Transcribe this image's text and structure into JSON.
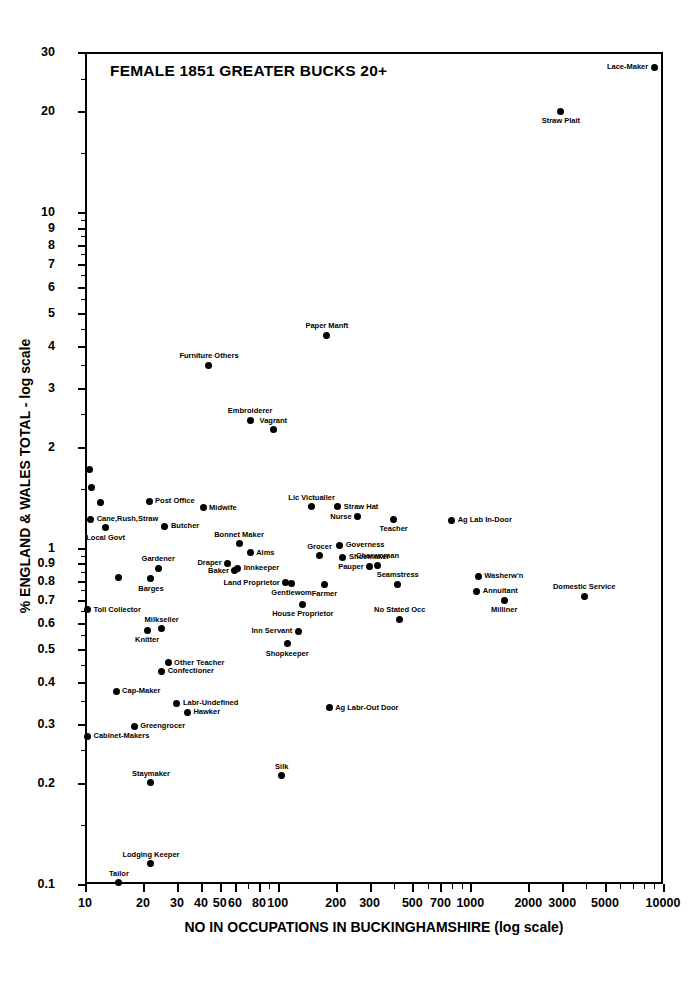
{
  "chart_data": {
    "type": "scatter",
    "title": "FEMALE 1851 GREATER BUCKS 20+",
    "xlabel": "NO IN OCCUPATIONS IN BUCKINGHAMSHIRE (log scale)",
    "ylabel": "% ENGLAND & WALES TOTAL - log scale",
    "xscale": "log",
    "yscale": "log",
    "xlim": [
      10,
      10000
    ],
    "ylim": [
      0.1,
      30
    ],
    "grid": false,
    "legend": "none",
    "marker_color": "#000000",
    "background_color": "#ffffff",
    "xticks": [
      {
        "value": 10,
        "label": "10",
        "major": true
      },
      {
        "value": 20,
        "label": "20",
        "major": true
      },
      {
        "value": 30,
        "label": "30",
        "major": true
      },
      {
        "value": 40,
        "label": "40",
        "major": true
      },
      {
        "value": 50,
        "label": "50",
        "major": true
      },
      {
        "value": 60,
        "label": "60",
        "major": true
      },
      {
        "value": 80,
        "label": "80",
        "major": true
      },
      {
        "value": 100,
        "label": "100",
        "major": true
      },
      {
        "value": 200,
        "label": "200",
        "major": true
      },
      {
        "value": 300,
        "label": "300",
        "major": true
      },
      {
        "value": 500,
        "label": "500",
        "major": true
      },
      {
        "value": 700,
        "label": "700",
        "major": true
      },
      {
        "value": 1000,
        "label": "1000",
        "major": true
      },
      {
        "value": 2000,
        "label": "2000",
        "major": true
      },
      {
        "value": 3000,
        "label": "3000",
        "major": true
      },
      {
        "value": 5000,
        "label": "5000",
        "major": true
      },
      {
        "value": 10000,
        "label": "10000",
        "major": true
      }
    ],
    "xminor": [
      70,
      90,
      400,
      600,
      800,
      900,
      4000,
      6000,
      7000,
      8000,
      9000
    ],
    "yticks": [
      {
        "value": 30,
        "label": "30"
      },
      {
        "value": 20,
        "label": "20"
      },
      {
        "value": 10,
        "label": "10"
      },
      {
        "value": 9,
        "label": "9"
      },
      {
        "value": 8,
        "label": "8"
      },
      {
        "value": 7,
        "label": "7"
      },
      {
        "value": 6,
        "label": "6"
      },
      {
        "value": 5,
        "label": "5"
      },
      {
        "value": 4,
        "label": "4"
      },
      {
        "value": 3,
        "label": "3"
      },
      {
        "value": 2,
        "label": "2"
      },
      {
        "value": 1,
        "label": "1"
      },
      {
        "value": 0.9,
        "label": "0.9"
      },
      {
        "value": 0.8,
        "label": "0.8"
      },
      {
        "value": 0.7,
        "label": "0.7"
      },
      {
        "value": 0.6,
        "label": "0.6"
      },
      {
        "value": 0.5,
        "label": "0.5"
      },
      {
        "value": 0.4,
        "label": "0.4"
      },
      {
        "value": 0.3,
        "label": "0.3"
      },
      {
        "value": 0.2,
        "label": "0.2"
      },
      {
        "value": 0.1,
        "label": "0.1"
      }
    ],
    "yminor": [
      0.15,
      0.25,
      0.35,
      0.45,
      0.55,
      0.65,
      0.75,
      0.85,
      0.95,
      1.5,
      2.5,
      3.5,
      4.5,
      5.5,
      6.5,
      7.5,
      8.5,
      9.5,
      15,
      25
    ],
    "points": [
      {
        "label": "Lace-Maker",
        "x": 9000,
        "y": 27.0,
        "anchor": "left"
      },
      {
        "label": "Straw Plait",
        "x": 2950,
        "y": 20.0,
        "anchor": "below"
      },
      {
        "label": "Paper Manft",
        "x": 180,
        "y": 4.3,
        "anchor": "above"
      },
      {
        "label": "Furniture Others",
        "x": 44,
        "y": 3.5,
        "anchor": "above"
      },
      {
        "label": "Embroiderer",
        "x": 72,
        "y": 2.4,
        "anchor": "above"
      },
      {
        "label": "Vagrant",
        "x": 95,
        "y": 2.25,
        "anchor": "above"
      },
      {
        "label": "",
        "x": 10.6,
        "y": 1.72,
        "anchor": "right"
      },
      {
        "label": "",
        "x": 10.8,
        "y": 1.52,
        "anchor": "right"
      },
      {
        "label": "",
        "x": 12.0,
        "y": 1.37,
        "anchor": "right"
      },
      {
        "label": "Post Office",
        "x": 21.5,
        "y": 1.38,
        "anchor": "right"
      },
      {
        "label": "Midwife",
        "x": 41,
        "y": 1.32,
        "anchor": "right"
      },
      {
        "label": "Lic Victualler",
        "x": 150,
        "y": 1.33,
        "anchor": "above"
      },
      {
        "label": "Straw Hat",
        "x": 205,
        "y": 1.33,
        "anchor": "right"
      },
      {
        "label": "Cane,Rush,Straw",
        "x": 10.7,
        "y": 1.22,
        "anchor": "right"
      },
      {
        "label": "Nurse",
        "x": 260,
        "y": 1.24,
        "anchor": "left"
      },
      {
        "label": "Teacher",
        "x": 400,
        "y": 1.22,
        "anchor": "below"
      },
      {
        "label": "Ag Lab In-Door",
        "x": 800,
        "y": 1.21,
        "anchor": "right"
      },
      {
        "label": "Local Govt",
        "x": 12.8,
        "y": 1.15,
        "anchor": "below"
      },
      {
        "label": "Butcher",
        "x": 26,
        "y": 1.16,
        "anchor": "right"
      },
      {
        "label": "Bonnet Maker",
        "x": 63,
        "y": 1.03,
        "anchor": "above"
      },
      {
        "label": "Governess",
        "x": 210,
        "y": 1.02,
        "anchor": "right"
      },
      {
        "label": "Alms",
        "x": 72,
        "y": 0.97,
        "anchor": "right"
      },
      {
        "label": "Grocer",
        "x": 165,
        "y": 0.95,
        "anchor": "above"
      },
      {
        "label": "Shoemaker",
        "x": 218,
        "y": 0.94,
        "anchor": "right"
      },
      {
        "label": "Draper",
        "x": 55,
        "y": 0.9,
        "anchor": "left"
      },
      {
        "label": "Gardener",
        "x": 24,
        "y": 0.87,
        "anchor": "above"
      },
      {
        "label": "Charwoman",
        "x": 330,
        "y": 0.89,
        "anchor": "above"
      },
      {
        "label": "Pauper",
        "x": 300,
        "y": 0.88,
        "anchor": "left"
      },
      {
        "label": "Innkeeper",
        "x": 62,
        "y": 0.87,
        "anchor": "right"
      },
      {
        "label": "Baker",
        "x": 60,
        "y": 0.855,
        "anchor": "left"
      },
      {
        "label": "",
        "x": 15,
        "y": 0.82,
        "anchor": "right"
      },
      {
        "label": "Barges",
        "x": 22,
        "y": 0.81,
        "anchor": "below"
      },
      {
        "label": "Washerw'n",
        "x": 1100,
        "y": 0.825,
        "anchor": "right"
      },
      {
        "label": "Land Proprietor",
        "x": 110,
        "y": 0.79,
        "anchor": "left"
      },
      {
        "label": "Gentlewom",
        "x": 118,
        "y": 0.785,
        "anchor": "below"
      },
      {
        "label": "Seamstress",
        "x": 420,
        "y": 0.78,
        "anchor": "above"
      },
      {
        "label": "Farmer",
        "x": 175,
        "y": 0.78,
        "anchor": "below"
      },
      {
        "label": "Annuitant",
        "x": 1080,
        "y": 0.745,
        "anchor": "right"
      },
      {
        "label": "Domestic Service",
        "x": 3900,
        "y": 0.72,
        "anchor": "above"
      },
      {
        "label": "Milliner",
        "x": 1500,
        "y": 0.7,
        "anchor": "below"
      },
      {
        "label": "House Proprietor",
        "x": 135,
        "y": 0.68,
        "anchor": "below"
      },
      {
        "label": "Toll Collector",
        "x": 10.3,
        "y": 0.655,
        "anchor": "right"
      },
      {
        "label": "No Stated Occ",
        "x": 430,
        "y": 0.615,
        "anchor": "above"
      },
      {
        "label": "Milkseller",
        "x": 25,
        "y": 0.575,
        "anchor": "above"
      },
      {
        "label": "Knitter",
        "x": 21,
        "y": 0.57,
        "anchor": "below"
      },
      {
        "label": "Inn Servant",
        "x": 128,
        "y": 0.565,
        "anchor": "left"
      },
      {
        "label": "Shopkeeper",
        "x": 112,
        "y": 0.52,
        "anchor": "below"
      },
      {
        "label": "Other Teacher",
        "x": 27,
        "y": 0.455,
        "anchor": "right"
      },
      {
        "label": "Confectioner",
        "x": 25,
        "y": 0.43,
        "anchor": "right"
      },
      {
        "label": "Cap-Maker",
        "x": 14.5,
        "y": 0.375,
        "anchor": "right"
      },
      {
        "label": "Labr-Undefined",
        "x": 30,
        "y": 0.345,
        "anchor": "right"
      },
      {
        "label": "Ag Labr-Out Door",
        "x": 185,
        "y": 0.335,
        "anchor": "right"
      },
      {
        "label": "Hawker",
        "x": 34,
        "y": 0.325,
        "anchor": "right"
      },
      {
        "label": "Greengrocer",
        "x": 18,
        "y": 0.295,
        "anchor": "right"
      },
      {
        "label": "Cabinet-Makers",
        "x": 10.3,
        "y": 0.275,
        "anchor": "right"
      },
      {
        "label": "Silk",
        "x": 105,
        "y": 0.21,
        "anchor": "above"
      },
      {
        "label": "Staymaker",
        "x": 22,
        "y": 0.2,
        "anchor": "above"
      },
      {
        "label": "Lodging  Keeper",
        "x": 22,
        "y": 0.115,
        "anchor": "above"
      },
      {
        "label": "Tailor",
        "x": 15,
        "y": 0.101,
        "anchor": "above"
      }
    ]
  }
}
